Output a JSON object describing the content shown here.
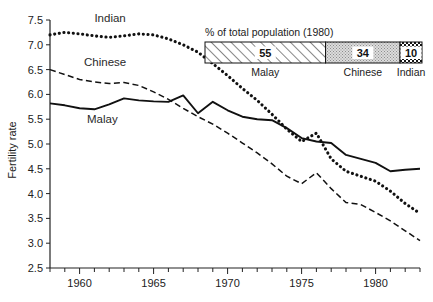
{
  "chart_data": {
    "type": "line",
    "title": "",
    "xlabel": "",
    "ylabel": "Fertility rate",
    "xlim": [
      1958,
      1983
    ],
    "ylim": [
      2.5,
      7.5
    ],
    "grid": false,
    "legend": "inline-labels",
    "xticks": [
      1960,
      1965,
      1970,
      1975,
      1980
    ],
    "xtick_labels": [
      "1960",
      "1965",
      "1970",
      "1975",
      "1980"
    ],
    "xminor_step": 1,
    "yticks": [
      2.5,
      3.0,
      3.5,
      4.0,
      4.5,
      5.0,
      5.5,
      6.0,
      6.5,
      7.0,
      7.5
    ],
    "ytick_labels": [
      "2.5",
      "3.0",
      "3.5",
      "4.0",
      "4.5",
      "5.0",
      "5.5",
      "6.0",
      "6.5",
      "7.0",
      "7.5"
    ],
    "x": [
      1958,
      1959,
      1960,
      1961,
      1962,
      1963,
      1964,
      1965,
      1966,
      1967,
      1968,
      1969,
      1970,
      1971,
      1972,
      1973,
      1974,
      1975,
      1976,
      1977,
      1978,
      1979,
      1980,
      1981,
      1982,
      1983
    ],
    "series": [
      {
        "name": "Indian",
        "style": "dotted",
        "color": "#111111",
        "label_x": 1961.0,
        "label_y": 7.46,
        "values": [
          7.2,
          7.25,
          7.22,
          7.18,
          7.15,
          7.18,
          7.22,
          7.2,
          7.12,
          7.0,
          6.85,
          6.62,
          6.38,
          6.12,
          5.88,
          5.6,
          5.3,
          5.05,
          5.22,
          4.7,
          4.45,
          4.35,
          4.25,
          4.05,
          3.8,
          3.6
        ]
      },
      {
        "name": "Chinese",
        "style": "dashed",
        "color": "#111111",
        "label_x": 1960.3,
        "label_y": 6.58,
        "values": [
          6.5,
          6.4,
          6.3,
          6.25,
          6.22,
          6.24,
          6.18,
          6.05,
          5.9,
          5.72,
          5.55,
          5.4,
          5.22,
          5.02,
          4.82,
          4.6,
          4.35,
          4.2,
          4.42,
          4.1,
          3.82,
          3.78,
          3.62,
          3.45,
          3.25,
          3.05
        ]
      },
      {
        "name": "Malay",
        "style": "solid",
        "color": "#111111",
        "label_x": 1960.5,
        "label_y": 5.42,
        "values": [
          5.82,
          5.78,
          5.72,
          5.7,
          5.8,
          5.92,
          5.88,
          5.86,
          5.85,
          5.98,
          5.62,
          5.85,
          5.68,
          5.55,
          5.5,
          5.48,
          5.32,
          5.12,
          5.05,
          5.02,
          4.78,
          4.7,
          4.62,
          4.45,
          4.48,
          4.5
        ]
      }
    ],
    "inset": {
      "title": "% of total population (1980)",
      "segments": [
        {
          "label": "Malay",
          "value": 55,
          "fill": "hatch-diagonal"
        },
        {
          "label": "Chinese",
          "value": 34,
          "fill": "stipple-light"
        },
        {
          "label": "Indian",
          "value": 10,
          "fill": "checker-dark"
        }
      ]
    }
  }
}
